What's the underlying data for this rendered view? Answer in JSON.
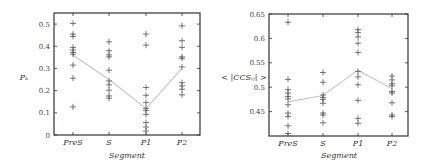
{
  "chart_data": [
    {
      "type": "scatter",
      "title": "",
      "xlabel": "Segment",
      "ylabel": "P_k",
      "ylabel_display": "Pₖ",
      "categories": [
        "PreS",
        "S",
        "P1",
        "P2"
      ],
      "ylim": [
        0,
        0.55
      ],
      "yticks": [
        0,
        0.1,
        0.2,
        0.3,
        0.4,
        0.5
      ],
      "ytick_labels": [
        "0",
        "0.1",
        "0.2",
        "0.3",
        "0.4",
        "0.5"
      ],
      "grid": false,
      "marker": "+",
      "points": {
        "PreS": [
          0.503,
          0.455,
          0.444,
          0.395,
          0.383,
          0.372,
          0.364,
          0.315,
          0.256,
          0.127
        ],
        "S": [
          0.42,
          0.38,
          0.361,
          0.352,
          0.292,
          0.244,
          0.226,
          0.202,
          0.176,
          0.166
        ],
        "P1": [
          0.455,
          0.405,
          0.214,
          0.179,
          0.146,
          0.12,
          0.111,
          0.093,
          0.056,
          0.036,
          0.018
        ],
        "P2": [
          0.492,
          0.425,
          0.395,
          0.352,
          0.346,
          0.307,
          0.236,
          0.221,
          0.206,
          0.181
        ]
      },
      "mean_line": [
        0.36,
        0.25,
        0.12,
        0.3
      ]
    },
    {
      "type": "scatter",
      "title": "",
      "xlabel": "Segment",
      "ylabel": "< |CCS_ij| >",
      "ylabel_display": "< |CCSᵢⱼ| >",
      "categories": [
        "PreS",
        "S",
        "P1",
        "P2"
      ],
      "ylim": [
        0.4,
        0.65
      ],
      "yticks": [
        0.45,
        0.5,
        0.55,
        0.6,
        0.65
      ],
      "ytick_labels": [
        "0.45",
        "0.5",
        "0.55",
        "0.6",
        "0.65"
      ],
      "grid": false,
      "marker": "+",
      "points": {
        "PreS": [
          0.633,
          0.516,
          0.495,
          0.488,
          0.481,
          0.476,
          0.464,
          0.447,
          0.44,
          0.421,
          0.405
        ],
        "S": [
          0.53,
          0.51,
          0.484,
          0.479,
          0.475,
          0.467,
          0.447,
          0.443,
          0.427
        ],
        "P1": [
          0.618,
          0.612,
          0.603,
          0.59,
          0.571,
          0.532,
          0.521,
          0.505,
          0.473,
          0.436,
          0.426
        ],
        "P2": [
          0.523,
          0.515,
          0.507,
          0.503,
          0.491,
          0.488,
          0.468,
          0.443,
          0.44
        ]
      },
      "mean_line": [
        0.47,
        0.483,
        0.535,
        0.497
      ]
    }
  ]
}
